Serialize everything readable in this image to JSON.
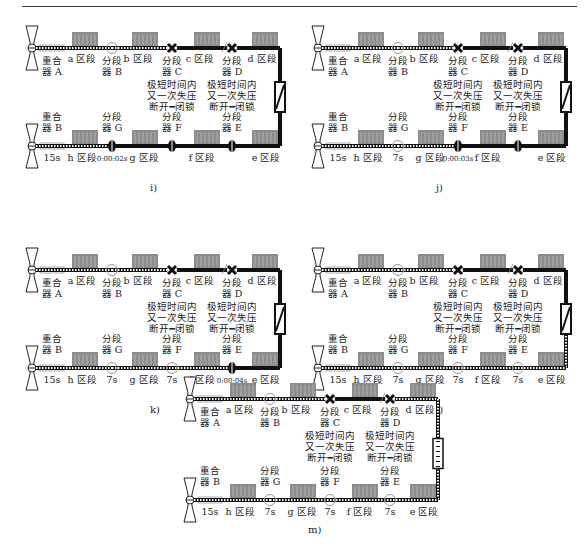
{
  "figure": {
    "panels": [
      {
        "id": "i",
        "caption": "i)",
        "top": {
          "recloser": "重合\n器 A",
          "sections": [
            "a 区段",
            "b 区段",
            "c 区段",
            "d 区段"
          ],
          "switches": [
            {
              "name": "分段\n器 B",
              "state": "circle",
              "note": ""
            },
            {
              "name": "分段\n器 C",
              "state": "x",
              "note": "极短时间内\n又一次失压\n断开━闭锁"
            },
            {
              "name": "分段\n器 D",
              "state": "x",
              "note": "极短时间内\n又一次失压\n断开━闭锁"
            }
          ],
          "energized_until": 2
        },
        "tie_switch": "closed",
        "bottom": {
          "recloser": "重合\n器 B",
          "recloser_time": "15s",
          "sections": [
            "h 区段",
            "g 区段",
            "f 区段",
            "e 区段"
          ],
          "switches": [
            {
              "name": "分段\n器 G",
              "state": "closed",
              "time": "0:00:02s"
            },
            {
              "name": "分段\n器 F",
              "state": "closed",
              "time": ""
            },
            {
              "name": "分段\n器 E",
              "state": "closed",
              "time": ""
            }
          ],
          "energized_until": 1
        }
      },
      {
        "id": "j",
        "caption": "j)",
        "top": {
          "recloser": "重合\n器 A",
          "sections": [
            "a 区段",
            "b 区段",
            "c 区段",
            "d 区段"
          ],
          "switches": [
            {
              "name": "分段\n器 B",
              "state": "circle",
              "note": ""
            },
            {
              "name": "分段\n器 C",
              "state": "x",
              "note": "极短时间内\n又一次失压\n断开━闭锁"
            },
            {
              "name": "分段\n器 D",
              "state": "x",
              "note": "极短时间内\n又一次失压\n断开━闭锁"
            }
          ],
          "energized_until": 2
        },
        "tie_switch": "closed",
        "bottom": {
          "recloser": "重合\n器 B",
          "recloser_time": "15s",
          "sections": [
            "h 区段",
            "g 区段",
            "f 区段",
            "e 区段"
          ],
          "switches": [
            {
              "name": "分段\n器 G",
              "state": "circle",
              "time": "7s"
            },
            {
              "name": "分段\n器 F",
              "state": "closed",
              "time": "0:00:03s"
            },
            {
              "name": "分段\n器 E",
              "state": "closed",
              "time": ""
            }
          ],
          "energized_until": 2
        }
      },
      {
        "id": "k",
        "caption": "k)",
        "top": {
          "recloser": "重合\n器 A",
          "sections": [
            "a 区段",
            "b 区段",
            "c 区段",
            "d 区段"
          ],
          "switches": [
            {
              "name": "分段\n器 B",
              "state": "circle",
              "note": ""
            },
            {
              "name": "分段\n器 C",
              "state": "x",
              "note": "极短时间内\n又一次失压\n断开━闭锁"
            },
            {
              "name": "分段\n器 D",
              "state": "x",
              "note": "极短时间内\n又一次失压\n断开━闭锁"
            }
          ],
          "energized_until": 2
        },
        "tie_switch": "closed",
        "bottom": {
          "recloser": "重合\n器 B",
          "recloser_time": "15s",
          "sections": [
            "h 区段",
            "g 区段",
            "f 区段",
            "e 区段"
          ],
          "switches": [
            {
              "name": "分段\n器 G",
              "state": "circle",
              "time": "7s"
            },
            {
              "name": "分段\n器 F",
              "state": "circle",
              "time": "7s"
            },
            {
              "name": "分段\n器 E",
              "state": "closed",
              "time": "0:00:04s"
            }
          ],
          "energized_until": 3
        }
      },
      {
        "id": "l",
        "caption": "l)",
        "top": {
          "recloser": "重合\n器 A",
          "sections": [
            "a 区段",
            "b 区段",
            "c 区段",
            "d 区段"
          ],
          "switches": [
            {
              "name": "分段\n器 B",
              "state": "circle",
              "note": ""
            },
            {
              "name": "分段\n器 C",
              "state": "x",
              "note": "极短时间内\n又一次失压\n断开━闭锁"
            },
            {
              "name": "分段\n器 D",
              "state": "x",
              "note": "极短时间内\n又一次失压\n断开━闭锁"
            }
          ],
          "energized_until": 2
        },
        "tie_switch": "closed",
        "bottom": {
          "recloser": "重合\n器 B",
          "recloser_time": "15s",
          "sections": [
            "h 区段",
            "g 区段",
            "f 区段",
            "e 区段"
          ],
          "switches": [
            {
              "name": "分段\n器 G",
              "state": "circle",
              "time": "7s"
            },
            {
              "name": "分段\n器 F",
              "state": "circle",
              "time": "7s"
            },
            {
              "name": "分段\n器 E",
              "state": "circle",
              "time": "7s"
            }
          ],
          "energized_until": 4
        }
      },
      {
        "id": "m",
        "caption": "m)",
        "top": {
          "recloser": "重合\n器 A",
          "sections": [
            "a 区段",
            "b 区段",
            "c 区段",
            "d 区段"
          ],
          "switches": [
            {
              "name": "分段\n器 B",
              "state": "circle",
              "note": ""
            },
            {
              "name": "分段\n器 C",
              "state": "x",
              "note": "极短时间内\n又一次失压\n断开━闭锁"
            },
            {
              "name": "分段\n器 D",
              "state": "x",
              "note": "极短时间内\n又一次失压\n断开━闭锁"
            }
          ],
          "energized_until": 2,
          "d_energized": true
        },
        "tie_switch": "open",
        "bottom": {
          "recloser": "重合\n器 B",
          "recloser_time": "15s",
          "sections": [
            "h 区段",
            "g 区段",
            "f 区段",
            "e 区段"
          ],
          "switches": [
            {
              "name": "分段\n器 G",
              "state": "circle",
              "time": "7s"
            },
            {
              "name": "分段\n器 F",
              "state": "circle",
              "time": "7s"
            },
            {
              "name": "分段\n器 E",
              "state": "circle",
              "time": "7s"
            }
          ],
          "energized_until": 4
        }
      }
    ]
  },
  "colors": {
    "line": "#111111",
    "energized_dash": "#ffffff",
    "building": "#8c8c8c",
    "circle": "#999999"
  }
}
